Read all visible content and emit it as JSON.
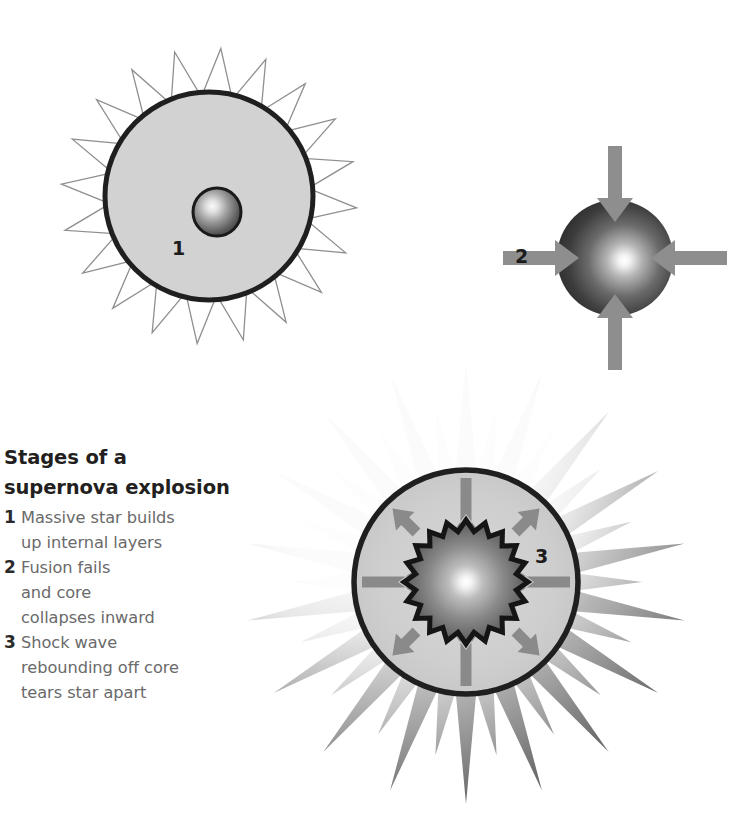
{
  "figure": {
    "title_line1": "Stages of a",
    "title_line2": "supernova explosion",
    "background_color": "#ffffff"
  },
  "legend": {
    "items": [
      {
        "number": "1",
        "lines": [
          "Massive star builds",
          "up internal layers"
        ]
      },
      {
        "number": "2",
        "lines": [
          "Fusion fails",
          "and core",
          "collapses inward"
        ]
      },
      {
        "number": "3",
        "lines": [
          "Shock wave",
          "rebounding off core",
          "tears star apart"
        ]
      }
    ]
  },
  "stages": [
    {
      "id": "stage-1",
      "label": "1",
      "description": "Massive star with outlined corona spikes, light gray body and small dark gradient core",
      "colors": {
        "body_fill": "#d2d2d2",
        "body_stroke": "#1f1f1f",
        "spike_stroke": "#8c8c8c",
        "core_center": "#f5f5f5",
        "core_edge": "#555555",
        "core_stroke": "#1a1a1a"
      },
      "geometry": {
        "center_x": 209,
        "center_y": 196,
        "body_radius": 104,
        "spike_outer_radius": 148,
        "spike_count": 20,
        "core_center_x": 217,
        "core_center_y": 212,
        "core_radius": 25
      }
    },
    {
      "id": "stage-2",
      "label": "2",
      "description": "Collapsing core: dark sphere with bright center and four inward arrows",
      "colors": {
        "sphere_center": "#ffffff",
        "sphere_edge": "#2c2c2c",
        "arrow_fill": "#8e8e8e"
      },
      "geometry": {
        "center_x": 615,
        "center_y": 258,
        "radius": 58,
        "arrow_count": 4,
        "arrow_directions": [
          "down",
          "left",
          "right",
          "up"
        ],
        "arrow_points": "inward"
      }
    },
    {
      "id": "stage-3",
      "label": "3",
      "description": "Shock wave: gradient corona spikes, gray star body, jagged gradient core, cardinal arrows inward and diagonal arrows outward",
      "colors": {
        "body_fill": "#cfcfcf",
        "body_stroke": "#1f1f1f",
        "spike_light": "#f3f3f3",
        "spike_dark": "#6e6e6e",
        "core_center": "#ffffff",
        "core_edge": "#4a4a4a",
        "core_stroke": "#151515",
        "arrow_fill": "#8a8a8a"
      },
      "geometry": {
        "center_x": 466,
        "center_y": 582,
        "body_radius": 112,
        "long_spike_radius": 222,
        "short_spike_radius": 176,
        "spike_count": 18,
        "core_outer_radius": 62,
        "core_inner_radius": 51,
        "core_points": 20,
        "arrow_count": 8,
        "cardinal_arrows": "inward",
        "diagonal_arrows": "outward"
      }
    }
  ]
}
